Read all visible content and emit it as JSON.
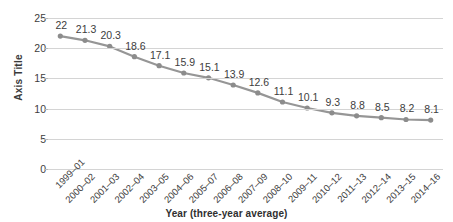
{
  "chart_data": {
    "type": "line",
    "title": "",
    "xlabel": "Year (three-year average)",
    "ylabel": "Axis Title",
    "ylim": [
      0,
      25
    ],
    "yticks": [
      0,
      5,
      10,
      15,
      20,
      25
    ],
    "ytick_labels": [
      "0",
      "5",
      "10",
      "15",
      "20",
      "25"
    ],
    "grid": true,
    "legend": "none",
    "line_color": "#969696",
    "marker_color": "#8c8c8c",
    "gridline_color": "#d4d4d4",
    "categories": [
      "1999–01",
      "2000–02",
      "2001–03",
      "2002–04",
      "2003–05",
      "2004–06",
      "2005–07",
      "2006–08",
      "2007–09",
      "2008–10",
      "2009–11",
      "2010–12",
      "2011–13",
      "2012–14",
      "2013–15",
      "2014–16"
    ],
    "values": [
      22,
      21.3,
      20.3,
      18.6,
      17.1,
      15.9,
      15.1,
      13.9,
      12.6,
      11.1,
      10.1,
      9.3,
      8.8,
      8.5,
      8.2,
      8.1
    ],
    "data_labels": [
      "22",
      "21.3",
      "20.3",
      "18.6",
      "17.1",
      "15.9",
      "15.1",
      "13.9",
      "12.6",
      "11.1",
      "10.1",
      "9.3",
      "8.8",
      "8.5",
      "8.2",
      "8.1"
    ]
  }
}
